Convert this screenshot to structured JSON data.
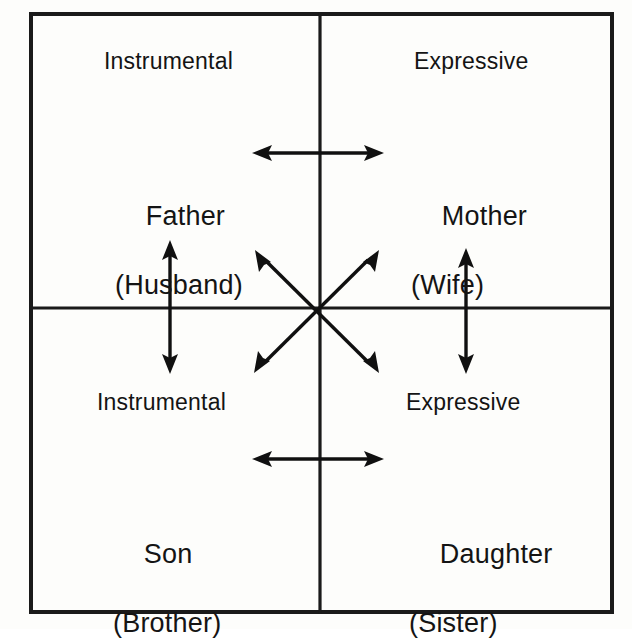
{
  "figure": {
    "kind": "quadrant-diagram",
    "background_color": "#fdfdfb",
    "line_color": "#101010"
  },
  "quadrants": {
    "top_left": {
      "axis_label": "Instrumental",
      "role_primary": "Father",
      "role_secondary": "(Husband)"
    },
    "top_right": {
      "axis_label": "Expressive",
      "role_primary": "Mother",
      "role_secondary": "(Wife)"
    },
    "bottom_left": {
      "axis_label": "Instrumental",
      "role_primary": "Son",
      "role_secondary": "(Brother)"
    },
    "bottom_right": {
      "axis_label": "Expressive",
      "role_primary": "Daughter",
      "role_secondary": "(Sister)"
    }
  },
  "connectors": [
    {
      "name": "top-horizontal-double-arrow",
      "orientation": "horizontal",
      "links": "Father (Husband) ↔ Mother (Wife)"
    },
    {
      "name": "bottom-horizontal-double-arrow",
      "orientation": "horizontal",
      "links": "Son (Brother) ↔ Daughter (Sister)"
    },
    {
      "name": "left-vertical-double-arrow",
      "orientation": "vertical",
      "links": "Father (Husband) ↕ Son (Brother)"
    },
    {
      "name": "right-vertical-double-arrow",
      "orientation": "vertical",
      "links": "Mother (Wife) ↕ Daughter (Sister)"
    },
    {
      "name": "diagonal-double-arrow-nw-se",
      "orientation": "diagonal",
      "links": "Father (Husband) ↔ Daughter (Sister)"
    },
    {
      "name": "diagonal-double-arrow-ne-sw",
      "orientation": "diagonal",
      "links": "Mother (Wife) ↔ Son (Brother)"
    }
  ]
}
